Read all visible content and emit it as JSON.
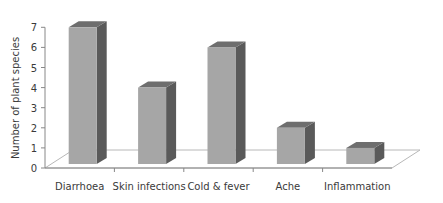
{
  "chart_data": {
    "type": "bar",
    "style": "3d-column",
    "title": "",
    "xlabel": "",
    "ylabel": "Number of plant species",
    "categories": [
      "Diarrhoea",
      "Skin infections",
      "Cold & fever",
      "Ache",
      "Inflammation"
    ],
    "values": [
      7,
      4,
      6,
      2,
      1
    ],
    "ylim": [
      0,
      7
    ],
    "yticks": [
      0,
      1,
      2,
      3,
      4,
      5,
      6,
      7
    ],
    "grid": false,
    "legend": null,
    "colors": {
      "bar_front": "#a6a6a6",
      "bar_side": "#5a5a5a",
      "bar_top": "#6e6e6e",
      "axis": "#888888",
      "floor": "#b8b8b8"
    }
  }
}
